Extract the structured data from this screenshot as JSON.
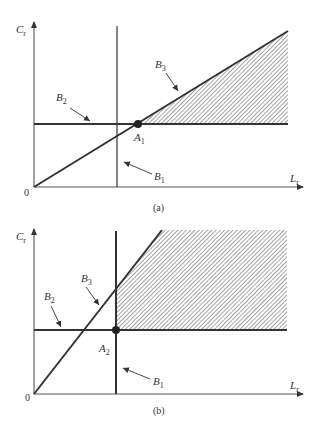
{
  "figure": {
    "panels": [
      {
        "id": "a",
        "caption": "(a)",
        "y_axis_label": "C",
        "y_axis_sub": "r",
        "x_axis_label": "L",
        "x_axis_sub": "r",
        "origin_label": "0",
        "point": {
          "label": "A",
          "sub": "1"
        },
        "lines": [
          {
            "label": "B",
            "sub": "1",
            "desc": "vertical line"
          },
          {
            "label": "B",
            "sub": "2",
            "desc": "horizontal line"
          },
          {
            "label": "B",
            "sub": "3",
            "desc": "diagonal line from origin"
          }
        ],
        "shaded_region": "hatched triangle above B2, below B3, right of A1"
      },
      {
        "id": "b",
        "caption": "(b)",
        "y_axis_label": "C",
        "y_axis_sub": "r",
        "x_axis_label": "L",
        "x_axis_sub": "r",
        "origin_label": "0",
        "point": {
          "label": "A",
          "sub": "2"
        },
        "lines": [
          {
            "label": "B",
            "sub": "1",
            "desc": "vertical line"
          },
          {
            "label": "B",
            "sub": "2",
            "desc": "horizontal line"
          },
          {
            "label": "B",
            "sub": "3",
            "desc": "steep diagonal line from origin"
          }
        ],
        "shaded_region": "hatched region above B2, right of B1, below B3"
      }
    ],
    "colors": {
      "line": "#333333",
      "hatch": "#555555",
      "background": "#ffffff"
    }
  }
}
